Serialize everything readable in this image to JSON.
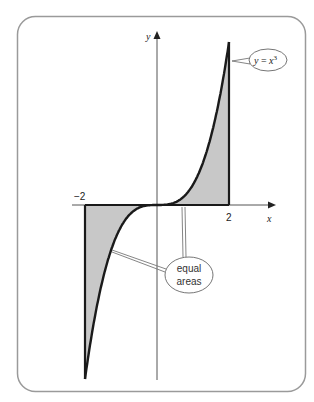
{
  "figure": {
    "frame_color": "#9a9a9a",
    "shade_color": "#c8c8c8",
    "curve_color": "#1a1a1a",
    "axes": {
      "x_label": "x",
      "y_label": "y",
      "ticks": [
        {
          "value": -2,
          "label": "−2"
        },
        {
          "value": 2,
          "label": "2"
        }
      ]
    },
    "curve_label": {
      "text_y": "y",
      "text_eq": " = ",
      "text_x": "x",
      "text_exp": "3"
    },
    "annotation": {
      "line1": "equal",
      "line2": "areas"
    }
  },
  "chart_data": {
    "type": "area",
    "title": "",
    "function": "y = x^3",
    "x": [
      -2,
      -1.5,
      -1,
      -0.5,
      0,
      0.5,
      1,
      1.5,
      2
    ],
    "y": [
      -8,
      -3.375,
      -1,
      -0.125,
      0,
      0.125,
      1,
      3.375,
      8
    ],
    "shaded_regions": [
      {
        "from": -2,
        "to": 0,
        "between": "curve and y=-8 boundary / x-axis region left of origin"
      },
      {
        "from": 0,
        "to": 2,
        "between": "curve and line x=2"
      }
    ],
    "xlabel": "x",
    "ylabel": "y",
    "xticks": [
      -2,
      2
    ],
    "annotations": [
      "y = x^3",
      "equal areas"
    ],
    "grid": false
  }
}
